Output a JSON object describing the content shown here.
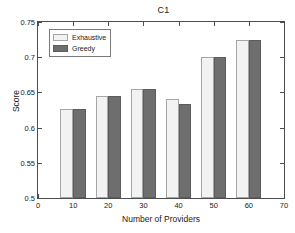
{
  "chart_data": {
    "type": "bar",
    "title": "C1",
    "xlabel": "Number of Providers",
    "ylabel": "Score",
    "x": [
      10,
      20,
      30,
      40,
      50,
      60
    ],
    "categories": [
      "10",
      "20",
      "30",
      "40",
      "50",
      "60"
    ],
    "series": [
      {
        "name": "Exhaustive",
        "color": "#f2f2f2",
        "values": [
          0.627,
          0.645,
          0.655,
          0.641,
          0.701,
          0.724
        ]
      },
      {
        "name": "Greedy",
        "color": "#6e6e6e",
        "values": [
          0.627,
          0.645,
          0.655,
          0.634,
          0.701,
          0.724
        ]
      }
    ],
    "xlim": [
      0,
      70
    ],
    "ylim": [
      0.5,
      0.75
    ],
    "xticks": [
      0,
      10,
      20,
      30,
      40,
      50,
      60,
      70
    ],
    "xtick_labels": [
      "0",
      "10",
      "20",
      "30",
      "40",
      "50",
      "60",
      "70"
    ],
    "yticks": [
      0.5,
      0.55,
      0.6,
      0.65,
      0.7,
      0.75
    ],
    "ytick_labels": [
      "0.5",
      "0.55",
      "0.6",
      "0.65",
      "0.7",
      "0.75"
    ],
    "grid": false,
    "legend_position": "top-left",
    "legend_entries": [
      "Exhaustive",
      "Greedy"
    ],
    "bar_group_width": 7.2,
    "axis_color": "#4d4d4d",
    "background": "#ffffff"
  }
}
